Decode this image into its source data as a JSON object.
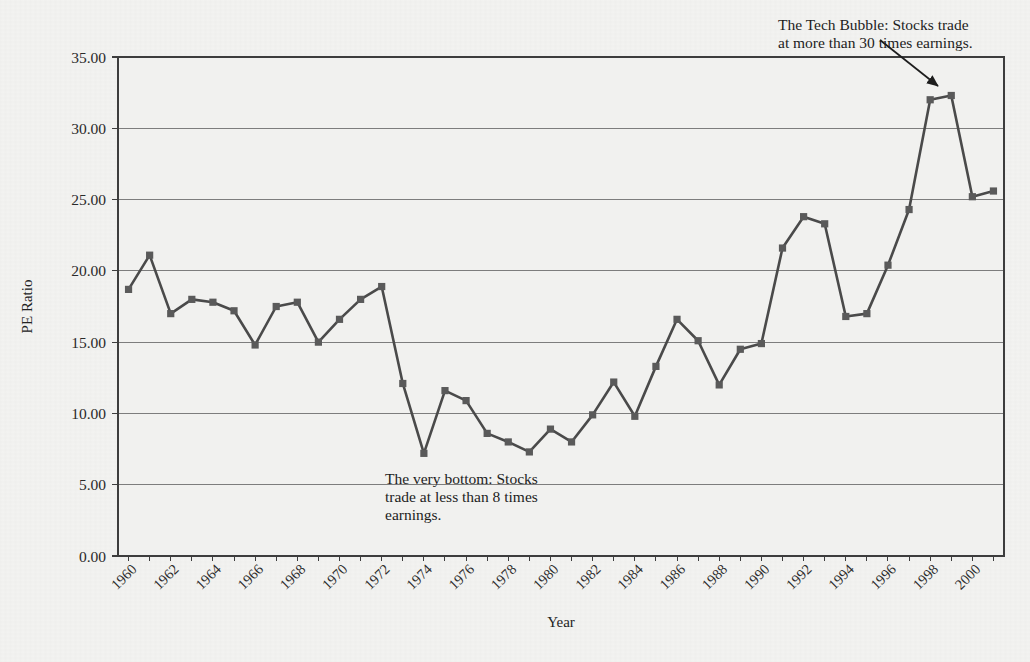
{
  "figure": {
    "caption": "FIGURE 2-5"
  },
  "chart_data": {
    "type": "line",
    "title": "",
    "xlabel": "Year",
    "ylabel": "PE Ratio",
    "grid": true,
    "legend_position": "none",
    "xlim": [
      1959.5,
      2001.5
    ],
    "ylim": [
      0.0,
      35.0
    ],
    "y_ticks": [
      "0.00",
      "5.00",
      "10.00",
      "15.00",
      "20.00",
      "25.00",
      "30.00",
      "35.00"
    ],
    "y_tick_values": [
      0,
      5,
      10,
      15,
      20,
      25,
      30,
      35
    ],
    "x_tick_labels": [
      "1960",
      "1962",
      "1964",
      "1966",
      "1968",
      "1970",
      "1972",
      "1974",
      "1976",
      "1978",
      "1980",
      "1982",
      "1984",
      "1986",
      "1988",
      "1990",
      "1992",
      "1994",
      "1996",
      "1998",
      "2000"
    ],
    "x_tick_values": [
      1960,
      1962,
      1964,
      1966,
      1968,
      1970,
      1972,
      1974,
      1976,
      1978,
      1980,
      1982,
      1984,
      1986,
      1988,
      1990,
      1992,
      1994,
      1996,
      1998,
      2000
    ],
    "series": [
      {
        "name": "PE Ratio",
        "marker": "square",
        "color": "#4a4a4a",
        "x": [
          1960,
          1961,
          1962,
          1963,
          1964,
          1965,
          1966,
          1967,
          1968,
          1969,
          1970,
          1971,
          1972,
          1973,
          1974,
          1975,
          1976,
          1977,
          1978,
          1979,
          1980,
          1981,
          1982,
          1983,
          1984,
          1985,
          1986,
          1987,
          1988,
          1989,
          1990,
          1991,
          1992,
          1993,
          1994,
          1995,
          1996,
          1997,
          1998,
          1999,
          2000,
          2001
        ],
        "values": [
          18.7,
          21.1,
          17.0,
          18.0,
          17.8,
          17.2,
          14.8,
          17.5,
          17.8,
          15.0,
          16.6,
          18.0,
          18.9,
          12.1,
          7.2,
          11.6,
          10.9,
          8.6,
          8.0,
          7.3,
          8.9,
          8.0,
          9.9,
          12.2,
          9.8,
          13.3,
          16.6,
          15.1,
          12.0,
          14.5,
          14.9,
          21.6,
          23.8,
          23.3,
          16.8,
          17.0,
          20.4,
          24.3,
          32.0,
          32.3,
          25.2,
          25.6
        ]
      }
    ],
    "annotations": [
      {
        "id": "tech-bubble",
        "lines": [
          "The Tech Bubble: Stocks trade",
          "at more than 30 times earnings."
        ],
        "text_x": 778,
        "text_y": 16,
        "arrow_from": [
          880,
          40
        ],
        "arrow_to": [
          938,
          86
        ]
      },
      {
        "id": "very-bottom",
        "lines": [
          "The very bottom: Stocks",
          "trade at less than 8 times",
          "earnings."
        ],
        "text_x": 385,
        "text_y": 470,
        "arrow_from": null,
        "arrow_to": null
      }
    ],
    "colors": {
      "plot_background": "#f1f1ef",
      "page_background": "#f3f3f1",
      "line": "#4a4a4a",
      "marker": "#5a5a5a",
      "gridline": "#7d7d7d",
      "axis": "#3d3d3d",
      "text": "#1d1d1d"
    }
  }
}
